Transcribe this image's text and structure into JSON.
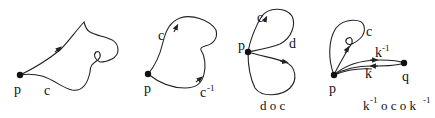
{
  "diagram": {
    "panels": [
      {
        "id": "path-c",
        "labels": {
          "point": "p",
          "curve": "c"
        }
      },
      {
        "id": "path-c-inverse",
        "labels": {
          "point": "p",
          "curve": "c",
          "inverse": "c",
          "inverse_exp": "-1"
        }
      },
      {
        "id": "composition-d-c",
        "labels": {
          "point": "p",
          "curve_c": "c",
          "curve_d": "d",
          "caption": "d o c"
        }
      },
      {
        "id": "conjugation",
        "labels": {
          "point_p": "p",
          "point_q": "q",
          "curve_c": "c",
          "k": "k",
          "k_inv": "k",
          "k_inv_exp": "-1",
          "caption_k1": "k",
          "caption_exp1": "-1",
          "caption_mid": "o c o k",
          "caption_exp2": "-1"
        }
      }
    ],
    "colors": {
      "stroke": "#222222",
      "point": "#111111",
      "background": "#ffffff"
    }
  }
}
